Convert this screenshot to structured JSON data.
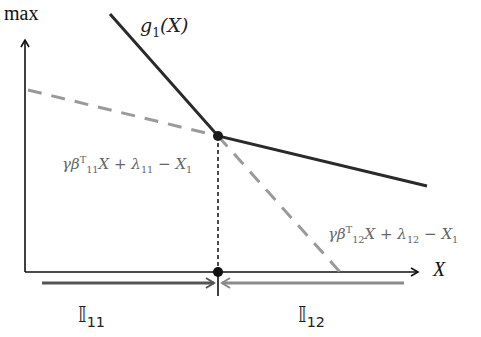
{
  "diagram": {
    "y_axis_label": "max",
    "x_axis_label": "X",
    "curve_label": {
      "func": "g",
      "sub": "1",
      "arg": "(X)"
    },
    "line_11_label": {
      "gamma": "γβ",
      "sup": "T",
      "sub": "11",
      "rest1": "X + λ",
      "sub2": "11",
      "rest2": " − X",
      "sub3": "1"
    },
    "line_12_label": {
      "gamma": "γβ",
      "sup": "T",
      "sub": "12",
      "rest1": "X + λ",
      "sub2": "12",
      "rest2": " − X",
      "sub3": "1"
    },
    "interval_11": {
      "symbol": "𝕀",
      "sub": "11"
    },
    "interval_12": {
      "symbol": "𝕀",
      "sub": "12"
    },
    "colors": {
      "axis": "#111111",
      "g_curve": "#2a2a2a",
      "dashed_line": "#9a9a9a",
      "arrow_11": "#555555",
      "arrow_12": "#8a8a8a",
      "label_gray": "#666666"
    }
  }
}
